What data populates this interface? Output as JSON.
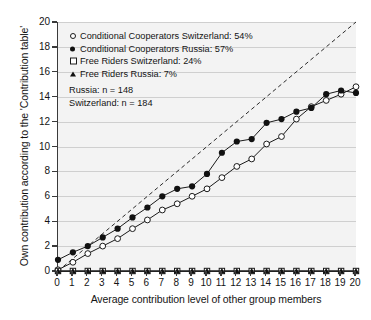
{
  "chart_data": {
    "type": "line",
    "title": "",
    "xlabel": "Average contribution level of other group members",
    "ylabel": "Own contribution according to the 'Contribution table'",
    "xlim": [
      0,
      20
    ],
    "ylim": [
      0,
      20
    ],
    "xticks": [
      0,
      1,
      2,
      3,
      4,
      5,
      6,
      7,
      8,
      9,
      10,
      11,
      12,
      13,
      14,
      15,
      16,
      17,
      18,
      19,
      20
    ],
    "yticks": [
      0,
      2,
      4,
      6,
      8,
      10,
      12,
      14,
      16,
      18,
      20
    ],
    "grid": "horizontal",
    "legend_position": "upper-left-inside",
    "x": [
      0,
      1,
      2,
      3,
      4,
      5,
      6,
      7,
      8,
      9,
      10,
      11,
      12,
      13,
      14,
      15,
      16,
      17,
      18,
      19,
      20
    ],
    "series": [
      {
        "name": "Conditional Cooperators Switzerland: 54%",
        "marker": "open-circle",
        "values": [
          0.1,
          0.7,
          1.4,
          2.0,
          2.6,
          3.4,
          4.1,
          4.9,
          5.4,
          6.0,
          6.6,
          7.5,
          8.4,
          9.0,
          10.2,
          10.8,
          12.2,
          13.2,
          13.7,
          14.2,
          14.8
        ]
      },
      {
        "name": "Conditional Cooperators Russia: 57%",
        "marker": "filled-circle",
        "values": [
          0.9,
          1.5,
          2.0,
          2.7,
          3.4,
          4.3,
          5.1,
          6.0,
          6.6,
          6.8,
          7.8,
          9.5,
          10.4,
          10.6,
          11.9,
          12.2,
          12.8,
          13.1,
          14.2,
          14.5,
          14.3
        ]
      },
      {
        "name": "Free Riders Switzerland: 24%",
        "marker": "open-square",
        "values": [
          0,
          0,
          0,
          0,
          0,
          0,
          0,
          0,
          0,
          0,
          0,
          0,
          0,
          0,
          0,
          0,
          0,
          0,
          0,
          0,
          0
        ]
      },
      {
        "name": "Free Riders Russia: 7%",
        "marker": "filled-triangle",
        "values": [
          0,
          0,
          0,
          0,
          0,
          0,
          0,
          0,
          0,
          0,
          0,
          0,
          0,
          0,
          0,
          0,
          0,
          0,
          0,
          0,
          0
        ]
      }
    ],
    "reference_line": {
      "name": "perfect-conditional-cooperation",
      "style": "dashed",
      "from": [
        0,
        0
      ],
      "to": [
        20,
        20
      ]
    },
    "annotations": [
      "Russia: n = 148",
      "Switzerland: n = 184"
    ]
  },
  "legend": {
    "items": [
      {
        "label": "Conditional Cooperators Switzerland: 54%",
        "marker": "open-circle"
      },
      {
        "label": "Conditional Cooperators Russia: 57%",
        "marker": "filled-circle"
      },
      {
        "label": "Free Riders Switzerland: 24%",
        "marker": "open-square"
      },
      {
        "label": "Free Riders Russia: 7%",
        "marker": "filled-triangle"
      }
    ],
    "notes": {
      "russia_n": "Russia: n = 148",
      "switzerland_n": "Switzerland: n = 184"
    }
  },
  "axes": {
    "x_title": "Average contribution level of other group members",
    "y_title": "Own contribution according to the 'Contribution table'",
    "x_tick_labels": [
      "0",
      "1",
      "2",
      "3",
      "4",
      "5",
      "6",
      "7",
      "8",
      "9",
      "10",
      "11",
      "12",
      "13",
      "14",
      "15",
      "16",
      "17",
      "18",
      "19",
      "20"
    ],
    "y_tick_labels": [
      "0",
      "2",
      "4",
      "6",
      "8",
      "10",
      "12",
      "14",
      "16",
      "18",
      "20"
    ]
  },
  "colors": {
    "plot_background": "#f3f3f3",
    "gridline": "#cfcfcf",
    "axis": "#3a3a3a",
    "series_dark": "#111111",
    "series_light": "#ffffff",
    "text": "#141414"
  }
}
